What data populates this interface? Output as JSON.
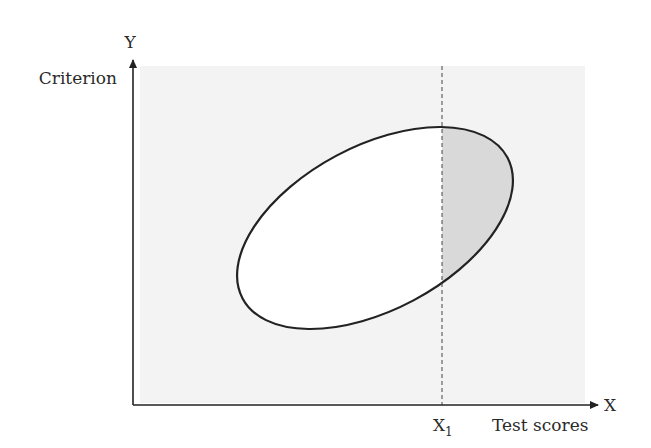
{
  "diagram": {
    "type": "scatter-ellipse",
    "title": "",
    "y_axis": {
      "symbol": "Y",
      "label": "Criterion"
    },
    "x_axis": {
      "symbol": "X",
      "label": "Test scores"
    },
    "cutoff": {
      "label": "X",
      "subscript": "1"
    },
    "regions": {
      "background": "applicant pool region (light gray)",
      "shaded": "portion of ellipse to the right of cutoff X1 (selected applicants)"
    },
    "colors": {
      "background_panel": "#f3f3f3",
      "shaded_region": "#d9d9d9",
      "ellipse_fill": "#ffffff",
      "stroke": "#222222"
    }
  }
}
